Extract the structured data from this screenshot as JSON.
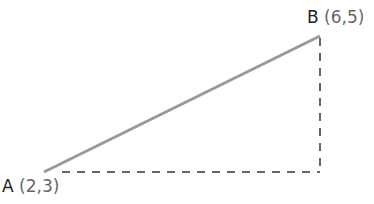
{
  "diagram": {
    "type": "right-triangle-slope",
    "points": [
      {
        "name": "A",
        "coords": "(2,3)",
        "x": 2,
        "y": 3
      },
      {
        "name": "B",
        "coords": "(6,5)",
        "x": 6,
        "y": 5
      }
    ],
    "segments": [
      {
        "from": "A",
        "to": "B",
        "style": "solid",
        "color": "#999999"
      },
      {
        "from": "A",
        "to": "C",
        "style": "dashed",
        "color": "#333333"
      },
      {
        "from": "C",
        "to": "B",
        "style": "dashed",
        "color": "#333333"
      }
    ]
  }
}
